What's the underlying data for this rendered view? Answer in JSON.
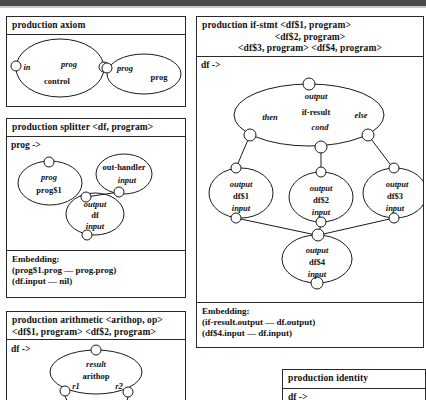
{
  "page": {
    "width": 426,
    "height": 400,
    "background": "#ffffff",
    "ink": "#1a1a1a"
  },
  "productions": {
    "axiom": {
      "title": "production axiom",
      "nodes": {
        "control": {
          "name": "control",
          "port_label": "in",
          "attr_label": "prog"
        },
        "prog": {
          "name": "prog",
          "port_label": "prog"
        }
      }
    },
    "splitter": {
      "title": "production splitter <df, program>",
      "lhs": "prog ->",
      "nodes": {
        "prog1": {
          "line1": "prog",
          "line2": "prog$1"
        },
        "outhandler": {
          "line1": "out-handler",
          "line2": "input"
        },
        "df": {
          "line1": "output",
          "line2": "df",
          "line3": "input"
        }
      },
      "embedding_title": "Embedding:",
      "embedding_lines": [
        "(prog$1.prog — prog.prog)",
        "(df.input — nil)"
      ]
    },
    "arithmetic": {
      "title_line1": "production arithmetic <arithop, op>",
      "title_line2": "<df$1, program>  <df$2, program>",
      "lhs": "df ->",
      "nodes": {
        "arithop": {
          "line1": "result",
          "line2": "arithop",
          "left_port": "r1",
          "right_port": "r2"
        }
      }
    },
    "ifstmt": {
      "title_line1": "production if-stmt <df$1, program>",
      "title_line2": "<df$2, program>",
      "title_line3": "<df$3, program>  <df$4, program>",
      "lhs": "df ->",
      "nodes": {
        "ifresult": {
          "line1": "output",
          "line2": "if-result",
          "port_then": "then",
          "port_else": "else",
          "port_cond": "cond"
        },
        "df1": {
          "line1": "output",
          "line2": "df$1",
          "line3": "input"
        },
        "df2": {
          "line1": "output",
          "line2": "df$2",
          "line3": "input"
        },
        "df3": {
          "line1": "output",
          "line2": "df$3",
          "line3": "input"
        },
        "df4": {
          "line1": "output",
          "line2": "df$4",
          "line3": "input"
        }
      },
      "embedding_title": "Embedding:",
      "embedding_lines": [
        "(if-result.output — df.output)",
        "(df$4.input — df.input)"
      ]
    },
    "identity": {
      "title": "production identity",
      "lhs": "df ->"
    }
  }
}
